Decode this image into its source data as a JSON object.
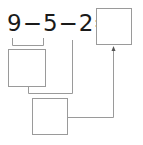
{
  "equation": {
    "term1": "9",
    "op1": "−",
    "term2": "5",
    "op2": "−",
    "term3": "2",
    "equals": "="
  },
  "boxes": {
    "result": "",
    "step1": "",
    "step2": ""
  },
  "colors": {
    "text": "#1a1a1a",
    "lines": "#9a9a9a"
  }
}
